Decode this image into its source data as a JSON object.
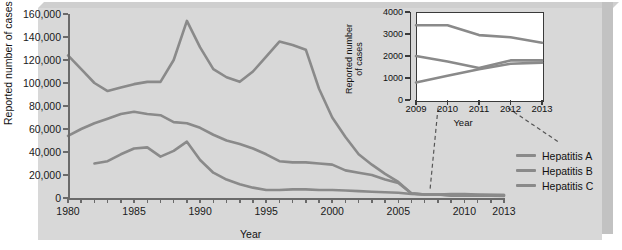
{
  "figure": {
    "background_color": "#d8d8d8",
    "line_color": "#8a8a8a",
    "axis_color": "#6a6a6a"
  },
  "chart_data": {
    "type": "line",
    "title": "",
    "xlabel": "Year",
    "ylabel": "Reported number of cases",
    "xlim": [
      1980,
      2013
    ],
    "ylim": [
      0,
      160000
    ],
    "grid": false,
    "legend_position": "right",
    "x_ticks": [
      1980,
      1985,
      1990,
      1995,
      2000,
      2005,
      2010,
      2013
    ],
    "x_tick_labels": [
      "1980",
      "1985",
      "1990",
      "1995",
      "2000",
      "2005",
      "2010",
      "2013"
    ],
    "y_ticks": [
      0,
      20000,
      40000,
      60000,
      80000,
      100000,
      120000,
      140000,
      160000
    ],
    "y_tick_labels": [
      "0",
      "20,000",
      "40,000",
      "60,000",
      "80,000",
      "100,000",
      "120,000",
      "140,000",
      "160,000"
    ],
    "series": [
      {
        "name": "Hepatitis A",
        "color": "#8a8a8a",
        "x": [
          1980,
          1981,
          1982,
          1983,
          1984,
          1985,
          1986,
          1987,
          1988,
          1989,
          1990,
          1991,
          1992,
          1993,
          1994,
          1995,
          1996,
          1997,
          1998,
          1999,
          2000,
          2001,
          2002,
          2003,
          2004,
          2005,
          2006,
          2007,
          2008,
          2009,
          2010,
          2011,
          2012,
          2013
        ],
        "y": [
          124000,
          112000,
          100000,
          93000,
          96000,
          99000,
          101000,
          101000,
          120000,
          154000,
          131000,
          112000,
          105000,
          101000,
          110000,
          123000,
          136000,
          133000,
          129000,
          95000,
          70000,
          53000,
          38000,
          29000,
          21000,
          14000,
          4000,
          3000,
          3000,
          2500,
          2500,
          2500,
          2500,
          2500
        ]
      },
      {
        "name": "Hepatitis B",
        "color": "#8a8a8a",
        "x": [
          1980,
          1981,
          1982,
          1983,
          1984,
          1985,
          1986,
          1987,
          1988,
          1989,
          1990,
          1991,
          1992,
          1993,
          1994,
          1995,
          1996,
          1997,
          1998,
          1999,
          2000,
          2001,
          2002,
          2003,
          2004,
          2005,
          2006,
          2007,
          2008,
          2009,
          2010,
          2011,
          2012,
          2013
        ],
        "y": [
          54000,
          60000,
          65000,
          69000,
          73000,
          75000,
          73000,
          72000,
          66000,
          65000,
          61000,
          55000,
          50000,
          47000,
          43000,
          38000,
          32000,
          31000,
          31000,
          30000,
          29000,
          24000,
          22000,
          20000,
          16000,
          13000,
          4000,
          3000,
          3000,
          2000,
          2000,
          2000,
          2000,
          1700
        ]
      },
      {
        "name": "Hepatitis C",
        "color": "#8a8a8a",
        "x": [
          1982,
          1983,
          1984,
          1985,
          1986,
          1987,
          1988,
          1989,
          1990,
          1991,
          1992,
          1993,
          1994,
          1995,
          1996,
          1997,
          1998,
          1999,
          2000,
          2001,
          2002,
          2003,
          2004,
          2005,
          2006,
          2007,
          2008,
          2009,
          2010,
          2011,
          2012,
          2013
        ],
        "y": [
          30000,
          32000,
          38000,
          43000,
          44000,
          36000,
          41000,
          49000,
          33000,
          22000,
          16000,
          12000,
          9000,
          7000,
          7000,
          7500,
          7500,
          7000,
          7000,
          6500,
          6000,
          5500,
          5000,
          4500,
          3500,
          3000,
          3000,
          3400,
          3400,
          3000,
          2800,
          2600
        ]
      }
    ]
  },
  "inset_chart": {
    "type": "line",
    "xlabel": "Year",
    "ylabel": "Reported number of cases",
    "xlim": [
      2009,
      2013
    ],
    "ylim": [
      0,
      4000
    ],
    "x_ticks": [
      2009,
      2010,
      2011,
      2012,
      2013
    ],
    "x_tick_labels": [
      "2009",
      "2010",
      "2011",
      "2012",
      "2013"
    ],
    "y_ticks": [
      0,
      1000,
      2000,
      3000,
      4000
    ],
    "y_tick_labels": [
      "0",
      "1000",
      "2000",
      "3000",
      "4000"
    ],
    "series": [
      {
        "name": "Hepatitis C",
        "color": "#8a8a8a",
        "x": [
          2009,
          2010,
          2011,
          2012,
          2013
        ],
        "y": [
          3400,
          3400,
          2950,
          2850,
          2600
        ]
      },
      {
        "name": "Hepatitis B",
        "color": "#8a8a8a",
        "x": [
          2009,
          2010,
          2011,
          2012,
          2013
        ],
        "y": [
          2000,
          1750,
          1450,
          1800,
          1800
        ]
      },
      {
        "name": "Hepatitis A",
        "color": "#8a8a8a",
        "x": [
          2009,
          2010,
          2011,
          2012,
          2013
        ],
        "y": [
          800,
          1100,
          1400,
          1650,
          1700
        ]
      }
    ]
  },
  "legend": {
    "items": [
      {
        "label": "Hepatitis A",
        "color": "#8a8a8a"
      },
      {
        "label": "Hepatitis B",
        "color": "#8a8a8a"
      },
      {
        "label": "Hepatitis C",
        "color": "#8a8a8a"
      }
    ]
  }
}
